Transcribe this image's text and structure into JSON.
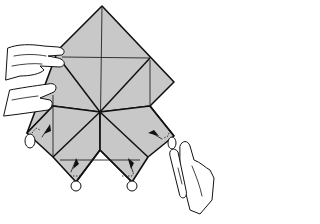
{
  "diagram": {
    "type": "origami-instruction",
    "description": "Hands holding a square folded diamond; four lower corners being squash-folded inward, indicated by arrows and dotted lines",
    "colors": {
      "paper": "#c8c8c8",
      "line": "#111111",
      "background": "#ffffff"
    },
    "elements": {
      "left_hand": "left-hand-holding-paper",
      "right_hand": "right-hand-pinching-corner",
      "arrows_count": 4,
      "corner_loops_count": 4
    }
  }
}
